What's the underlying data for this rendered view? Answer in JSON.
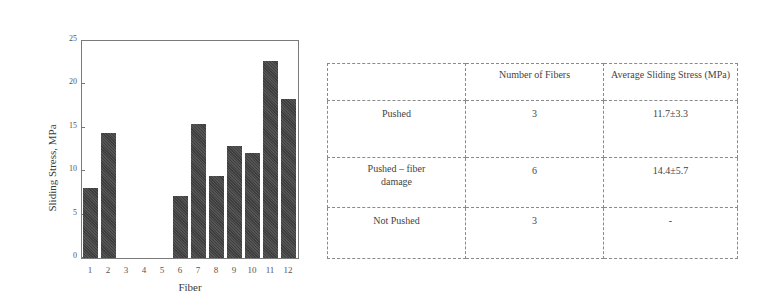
{
  "chart_data": {
    "type": "bar",
    "title": "",
    "xlabel": "Fiber",
    "ylabel": "Sliding Stress, MPa",
    "ylim": [
      0,
      25
    ],
    "yticks": [
      0,
      5,
      10,
      15,
      20,
      25
    ],
    "grid": false,
    "legend": null,
    "categories": [
      "1",
      "2",
      "3",
      "4",
      "5",
      "6",
      "7",
      "8",
      "9",
      "10",
      "11",
      "12"
    ],
    "values": [
      8.1,
      14.4,
      0,
      0,
      0,
      7.1,
      15.4,
      9.5,
      12.9,
      12.1,
      22.7,
      18.3
    ],
    "bar_color": "#4a4a4a"
  },
  "chart": {
    "xlabel": "Fiber",
    "ylabel": "Sliding Stress, MPa",
    "yticks": [
      "0",
      "5",
      "10",
      "15",
      "20",
      "25"
    ],
    "xticks": [
      "1",
      "2",
      "3",
      "4",
      "5",
      "6",
      "7",
      "8",
      "9",
      "10",
      "11",
      "12"
    ]
  },
  "table": {
    "headers": [
      "",
      "Number of Fibers",
      "Average Sliding Stress (MPa)"
    ],
    "rows": [
      {
        "label": "Pushed",
        "count": "3",
        "avg": "11.7±3.3"
      },
      {
        "label": "Pushed – fiber damage",
        "count": "6",
        "avg": "14.4±5.7"
      },
      {
        "label": "Not Pushed",
        "count": "3",
        "avg": "-"
      }
    ]
  }
}
